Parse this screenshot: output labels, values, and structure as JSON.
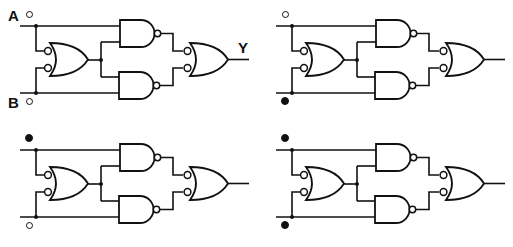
{
  "diagram": {
    "title": "",
    "colors": {
      "ink": "#111111",
      "background": "#ffffff"
    },
    "labels": {
      "input_a": "A",
      "input_b": "B",
      "output": "Y"
    },
    "legend": {
      "open_circle": "logic 0 / low",
      "filled_circle": "logic 1 / high"
    },
    "panels": [
      {
        "id": "panel-1",
        "position": "top-left",
        "x": 0,
        "y": 0,
        "show_labels": true,
        "input_a": "open",
        "input_b": "open"
      },
      {
        "id": "panel-2",
        "position": "top-right",
        "x": 256,
        "y": 0,
        "show_labels": false,
        "input_a": "open",
        "input_b": "filled"
      },
      {
        "id": "panel-3",
        "position": "bottom-left",
        "x": 0,
        "y": 124,
        "show_labels": false,
        "input_a": "filled",
        "input_b": "open"
      },
      {
        "id": "panel-4",
        "position": "bottom-right",
        "x": 256,
        "y": 124,
        "show_labels": false,
        "input_a": "filled",
        "input_b": "filled"
      }
    ],
    "components": [
      {
        "type": "or-inverted-inputs",
        "role": "input-gate",
        "inputs": [
          "A",
          "B"
        ]
      },
      {
        "type": "nand",
        "role": "upper-gate",
        "inputs": [
          "A",
          "G1"
        ]
      },
      {
        "type": "nand",
        "role": "lower-gate",
        "inputs": [
          "G1",
          "B"
        ]
      },
      {
        "type": "or-inverted-inputs",
        "role": "output-gate",
        "inputs": [
          "N1",
          "N2"
        ],
        "output": "Y"
      }
    ]
  }
}
